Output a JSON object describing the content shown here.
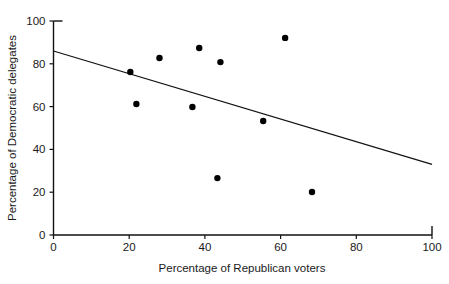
{
  "chart_data": {
    "type": "scatter",
    "title": "",
    "xlabel": "Percentage of Republican voters",
    "ylabel": "Percentage of Democratic delegates",
    "xlim": [
      0,
      100
    ],
    "ylim": [
      0,
      100
    ],
    "xticks": [
      0,
      20,
      40,
      60,
      80,
      100
    ],
    "yticks": [
      0,
      20,
      40,
      60,
      80,
      100
    ],
    "xtick_labels": [
      "0",
      "20",
      "40",
      "60",
      "80",
      "100"
    ],
    "ytick_labels": [
      "0",
      "20",
      "40",
      "60",
      "80",
      "100"
    ],
    "grid": false,
    "legend": false,
    "marker_color": "#000000",
    "line_color": "#111111",
    "axis_color": "#111111",
    "background": "#ffffff",
    "points": [
      {
        "x": 20.3,
        "y": 76.2
      },
      {
        "x": 21.9,
        "y": 61.2
      },
      {
        "x": 28.0,
        "y": 82.7
      },
      {
        "x": 36.7,
        "y": 59.8
      },
      {
        "x": 38.5,
        "y": 87.4
      },
      {
        "x": 43.3,
        "y": 26.6
      },
      {
        "x": 44.1,
        "y": 80.8
      },
      {
        "x": 55.4,
        "y": 53.3
      },
      {
        "x": 61.2,
        "y": 92.1
      },
      {
        "x": 68.3,
        "y": 20.1
      }
    ],
    "trend_line": {
      "x0": 0,
      "y0": 86.0,
      "x1": 100,
      "y1": 33.0
    }
  }
}
